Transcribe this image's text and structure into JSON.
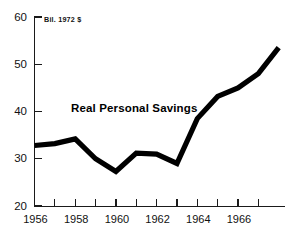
{
  "chart_data": {
    "type": "line",
    "title": "Real Personal Savings",
    "subtitle": "Bil. 1972 $",
    "xlabel": "",
    "ylabel": "",
    "unit_note": "Bil. 1972 $",
    "series_label": "Real Personal Savings",
    "x": [
      1956,
      1957,
      1958,
      1959,
      1960,
      1961,
      1962,
      1963,
      1964,
      1965,
      1966,
      1967,
      1968
    ],
    "values": [
      32.8,
      33.2,
      34.2,
      30.0,
      27.3,
      31.2,
      31.0,
      29.0,
      38.5,
      43.2,
      45.0,
      48.0,
      53.5
    ],
    "series": [
      {
        "name": "Real Personal Savings",
        "values": [
          32.8,
          33.2,
          34.2,
          30.0,
          27.3,
          31.2,
          31.0,
          29.0,
          38.5,
          43.2,
          45.0,
          48.0,
          53.5
        ]
      }
    ],
    "xlim": [
      1956,
      1968
    ],
    "ylim": [
      20,
      60
    ],
    "y_ticks": [
      20,
      30,
      40,
      50,
      60
    ],
    "y_tick_labels": [
      "20",
      "30",
      "40",
      "50",
      "60"
    ],
    "x_ticks": [
      1956,
      1957,
      1958,
      1959,
      1960,
      1961,
      1962,
      1963,
      1964,
      1965,
      1966,
      1967
    ],
    "x_tick_labels_shown": [
      "1956",
      "1958",
      "1960",
      "1962",
      "1964",
      "1966"
    ],
    "x_labeled_ticks": [
      1956,
      1958,
      1960,
      1962,
      1964,
      1966
    ],
    "grid": false,
    "legend": "none",
    "line_color": "#000000",
    "axis_color": "#1a1a1a",
    "background_color": "#ffffff"
  },
  "axes": {
    "y_labels": [
      "60",
      "50",
      "40",
      "30",
      "20"
    ],
    "x_labels": [
      "1956",
      "1958",
      "1960",
      "1962",
      "1964",
      "1966"
    ]
  }
}
